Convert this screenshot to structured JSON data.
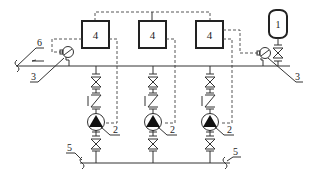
{
  "diagram": {
    "type": "pump-station-schematic",
    "labels": {
      "tank": "1",
      "pump": "2",
      "sensor_left": "3",
      "sensor_right": "3",
      "controller": "4",
      "inlet_pipe_left": "5",
      "inlet_pipe_right": "5",
      "outlet_pipe": "6"
    },
    "controllers": [
      {
        "label": "4"
      },
      {
        "label": "4"
      },
      {
        "label": "4"
      }
    ],
    "pumps": [
      {
        "label": "2"
      },
      {
        "label": "2"
      },
      {
        "label": "2"
      }
    ],
    "colors": {
      "line": "#333333",
      "background": "#ffffff",
      "pump_fill": "#111111"
    }
  }
}
